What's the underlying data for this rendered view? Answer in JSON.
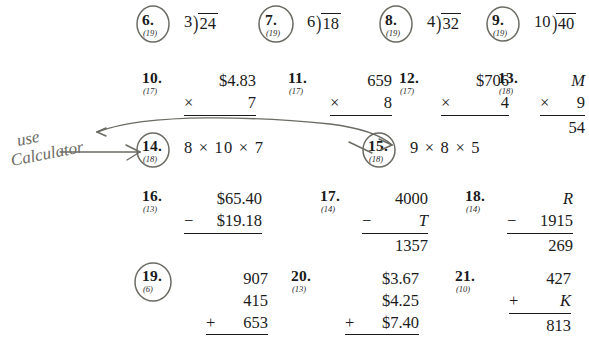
{
  "page": {
    "background_color": "#ffffff",
    "ink_color": "#1a1a1a",
    "annotation_color": "#5a5a52"
  },
  "handwriting": {
    "note_line1": "use",
    "note_line2": "Calculator"
  },
  "problems": [
    {
      "id": "6",
      "number": "6.",
      "lesson": "(19)",
      "circled": true,
      "type": "long-division",
      "divisor": "3",
      "bracket": ")",
      "dividend": "24"
    },
    {
      "id": "7",
      "number": "7.",
      "lesson": "(19)",
      "circled": true,
      "type": "long-division",
      "divisor": "6",
      "bracket": ")",
      "dividend": "18"
    },
    {
      "id": "8",
      "number": "8.",
      "lesson": "(19)",
      "circled": true,
      "type": "long-division",
      "divisor": "4",
      "bracket": ")",
      "dividend": "32"
    },
    {
      "id": "9",
      "number": "9.",
      "lesson": "(19)",
      "circled": true,
      "type": "long-division",
      "divisor": "10",
      "bracket": ")",
      "dividend": "40"
    },
    {
      "id": "10",
      "number": "10.",
      "lesson": "(17)",
      "circled": false,
      "type": "column",
      "top": "$4.83",
      "op": "×",
      "bottom": "7",
      "answer": ""
    },
    {
      "id": "11",
      "number": "11.",
      "lesson": "(17)",
      "circled": false,
      "type": "column",
      "top": "659",
      "op": "×",
      "bottom": "8",
      "answer": ""
    },
    {
      "id": "12",
      "number": "12.",
      "lesson": "(17)",
      "circled": false,
      "type": "column",
      "top": "$706",
      "op": "×",
      "bottom": "4",
      "answer": ""
    },
    {
      "id": "13",
      "number": "13.",
      "lesson": "(18)",
      "circled": false,
      "type": "column",
      "top": "M",
      "top_italic": true,
      "op": "×",
      "bottom": "9",
      "answer": "54"
    },
    {
      "id": "14",
      "number": "14.",
      "lesson": "(18)",
      "circled": true,
      "type": "inline",
      "expression": "8 × 10 × 7"
    },
    {
      "id": "15",
      "number": "15.",
      "lesson": "(18)",
      "circled": true,
      "type": "inline",
      "expression": "9 × 8 × 5"
    },
    {
      "id": "16",
      "number": "16.",
      "lesson": "(13)",
      "circled": false,
      "type": "column",
      "top": "$65.40",
      "op": "−",
      "bottom": "$19.18",
      "answer": ""
    },
    {
      "id": "17",
      "number": "17.",
      "lesson": "(14)",
      "circled": false,
      "type": "column",
      "top": "4000",
      "op": "−",
      "bottom": "T",
      "bottom_italic": true,
      "answer": "1357"
    },
    {
      "id": "18",
      "number": "18.",
      "lesson": "(14)",
      "circled": false,
      "type": "column",
      "top": "R",
      "top_italic": true,
      "op": "−",
      "bottom": "1915",
      "answer": "269"
    },
    {
      "id": "19",
      "number": "19.",
      "lesson": "(6)",
      "circled": true,
      "type": "column3",
      "row1": "907",
      "row2": "415",
      "op": "+",
      "bottom": "653",
      "answer": ""
    },
    {
      "id": "20",
      "number": "20.",
      "lesson": "(13)",
      "circled": false,
      "type": "column3",
      "row1": "$3.67",
      "row2": "$4.25",
      "op": "+",
      "bottom": "$7.40",
      "answer": ""
    },
    {
      "id": "21",
      "number": "21.",
      "lesson": "(10)",
      "circled": false,
      "type": "column",
      "top": "427",
      "op": "+",
      "bottom": "K",
      "bottom_italic": true,
      "answer": "813"
    }
  ]
}
